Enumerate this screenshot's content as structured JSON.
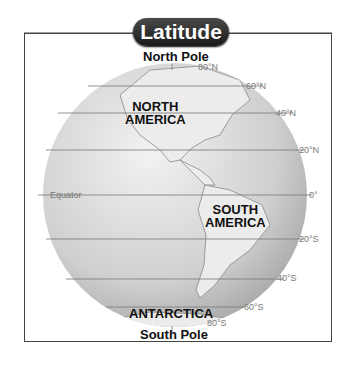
{
  "title": "Latitude",
  "poles": {
    "north": "North Pole",
    "south": "South Pole"
  },
  "continents": {
    "north_america": [
      "NORTH",
      "AMERICA"
    ],
    "south_america": [
      "SOUTH",
      "AMERICA"
    ],
    "antarctica": "ANTARCTICA"
  },
  "equator_label": "Equator",
  "latitudes": [
    {
      "label": "80°N",
      "y": 74
    },
    {
      "label": "60°N",
      "y": 86
    },
    {
      "label": "40°N",
      "y": 113
    },
    {
      "label": "20°N",
      "y": 150
    },
    {
      "label": "0°",
      "y": 195
    },
    {
      "label": "20°S",
      "y": 239
    },
    {
      "label": "40°S",
      "y": 279
    },
    {
      "label": "60°S",
      "y": 307
    },
    {
      "label": "80°S",
      "y": 322
    }
  ],
  "colors": {
    "globe_light": "#e8e8e8",
    "globe_dark": "#a8a8a8",
    "lines": "#777777",
    "pill": "#2a2a2a"
  }
}
